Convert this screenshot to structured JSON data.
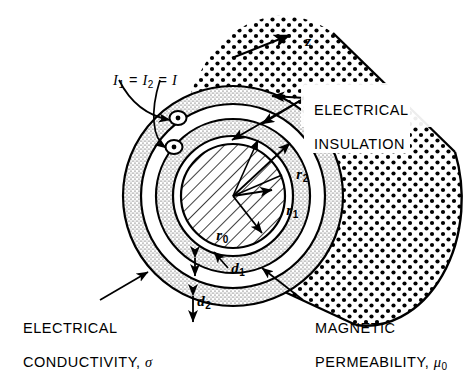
{
  "figure": {
    "type": "technical-line-diagram",
    "background": "#ffffff",
    "ink": "#000000"
  },
  "axis": {
    "label": "z",
    "description": "cylinder-axis-direction-arrow"
  },
  "current_label": {
    "text": "I",
    "sub1": "1",
    "eq1": " = ",
    "text2": "I",
    "sub2": "2",
    "eq2": " = ",
    "text3": "I",
    "full": "I1 = I2 = I",
    "symbol": "current-out-of-page-dot"
  },
  "callouts": [
    {
      "name": "electrical-insulation",
      "line1": "ELECTRICAL",
      "line2": "INSULATION"
    },
    {
      "name": "electrical-conductivity",
      "line1": "ELECTRICAL",
      "line2": "CONDUCTIVITY, ",
      "sigma": "σ"
    },
    {
      "name": "magnetic-permeability",
      "line1": "MAGNETIC",
      "line2": "PERMEABILITY, ",
      "mu": "μ",
      "mu_sub": "0"
    }
  ],
  "dimensions": [
    {
      "name": "r0",
      "base": "r",
      "sub": "0",
      "meaning": "core-radius"
    },
    {
      "name": "r1",
      "base": "r",
      "sub": "1",
      "meaning": "inner-conductor-outer-radius"
    },
    {
      "name": "r2",
      "base": "r",
      "sub": "2",
      "meaning": "outer-conductor-outer-radius"
    },
    {
      "name": "d1",
      "base": "d",
      "sub": "1",
      "meaning": "inner-conductor-thickness"
    },
    {
      "name": "d2",
      "base": "d",
      "sub": "2",
      "meaning": "outer-conductor-thickness"
    }
  ],
  "regions": [
    {
      "name": "core",
      "fill": "diagonal-hatch"
    },
    {
      "name": "inner-conductor-annulus",
      "fill": "fine-stipple"
    },
    {
      "name": "outer-conductor-annulus",
      "fill": "fine-stipple"
    },
    {
      "name": "insulation-body",
      "fill": "coarse-dots"
    }
  ]
}
